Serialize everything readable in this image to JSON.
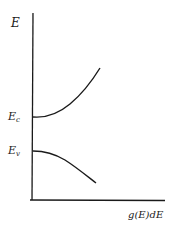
{
  "diagram": {
    "y_axis_label": "E",
    "x_axis_label": "g(E)dE",
    "levels": [
      {
        "name": "conduction-band-edge",
        "symbol": "E",
        "subscript": "c"
      },
      {
        "name": "valence-band-edge",
        "symbol": "E",
        "subscript": "v"
      }
    ],
    "curves": [
      {
        "name": "conduction-band-density-of-states",
        "description": "Rises from E_c"
      },
      {
        "name": "valence-band-density-of-states",
        "description": "Falls below E_v"
      }
    ],
    "colors": {
      "line": "#1a1a1a",
      "background": "#ffffff"
    }
  }
}
